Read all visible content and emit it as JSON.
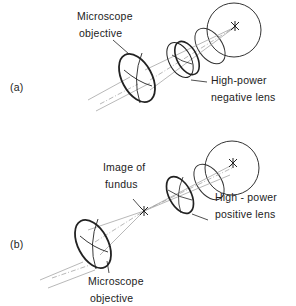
{
  "panel_a": {
    "tag": "(a)",
    "objective_label_line1": "Microscope",
    "objective_label_line2": "objective",
    "lens_label_line1": "High-power",
    "lens_label_line2": "negative lens"
  },
  "panel_b": {
    "tag": "(b)",
    "image_label_line1": "Image of",
    "image_label_line2": "fundus",
    "lens_label_line1": "High - power",
    "lens_label_line2": "positive lens",
    "objective_label_line1": "Microscope",
    "objective_label_line2": "objective"
  },
  "colors": {
    "ink": "#222222",
    "ray": "#8a8a8a"
  }
}
